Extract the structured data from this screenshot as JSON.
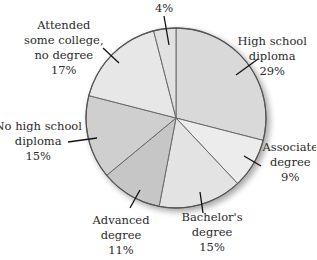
{
  "chart_data": {
    "type": "pie",
    "title": "",
    "start_angle_deg": 0,
    "direction": "clockwise",
    "slices": [
      {
        "label": "High school diploma",
        "value": 29,
        "text": [
          "High school",
          "diploma",
          "29%"
        ],
        "color": "#d9d9d9"
      },
      {
        "label": "Associate degree",
        "value": 9,
        "text": [
          "Associate",
          "degree",
          "9%"
        ],
        "color": "#ececec"
      },
      {
        "label": "Bachelor's degree",
        "value": 15,
        "text": [
          "Bachelor's",
          "degree",
          "15%"
        ],
        "color": "#e3e3e3"
      },
      {
        "label": "Advanced degree",
        "value": 11,
        "text": [
          "Advanced",
          "degree",
          "11%"
        ],
        "color": "#c6c6c6"
      },
      {
        "label": "No high school diploma",
        "value": 15,
        "text": [
          "No high school",
          "diploma",
          "15%"
        ],
        "color": "#cfcfcf"
      },
      {
        "label": "Attended some college, no degree",
        "value": 17,
        "text": [
          "Attended",
          "some college,",
          "no degree",
          "17%"
        ],
        "color": "#e7e7e7"
      },
      {
        "label": "",
        "value": 4,
        "text": [
          "4%"
        ],
        "color": "#e1e1e1"
      }
    ]
  }
}
